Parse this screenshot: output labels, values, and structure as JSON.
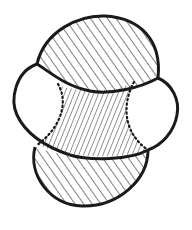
{
  "figure": {
    "colors": {
      "stroke": "#1a1a1a",
      "hatch": "#2a2a2a",
      "background": "#ffffff"
    },
    "regions": [
      {
        "name": "top-dome",
        "fill": "hatched",
        "hatch_direction": "up-right"
      },
      {
        "name": "left-bulge",
        "fill": "white"
      },
      {
        "name": "right-bulge",
        "fill": "white"
      },
      {
        "name": "center-waist",
        "fill": "hatched",
        "hatch_direction": "steep down-right",
        "edges": "dotted"
      },
      {
        "name": "bottom-bowl",
        "fill": "hatched",
        "hatch_direction": "up-right"
      }
    ]
  }
}
